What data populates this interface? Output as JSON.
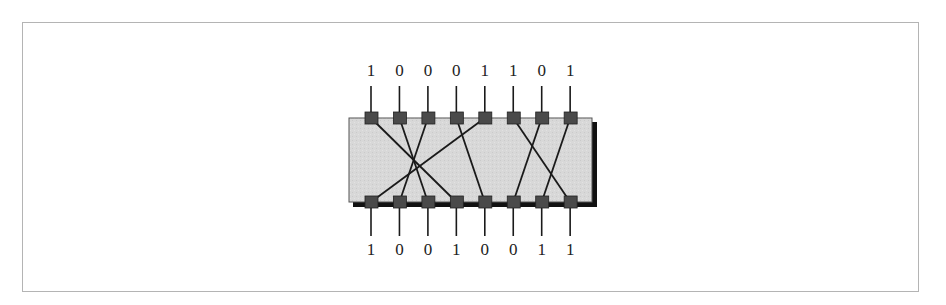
{
  "diagram": {
    "type": "bit-permutation-box",
    "pin_count": 8,
    "input_bits": [
      "1",
      "0",
      "0",
      "0",
      "1",
      "1",
      "0",
      "1"
    ],
    "output_bits": [
      "1",
      "0",
      "0",
      "1",
      "0",
      "0",
      "1",
      "1"
    ],
    "wiring": [
      {
        "from_input": 1,
        "to_output": 4
      },
      {
        "from_input": 2,
        "to_output": 3
      },
      {
        "from_input": 3,
        "to_output": 2
      },
      {
        "from_input": 4,
        "to_output": 5
      },
      {
        "from_input": 5,
        "to_output": 1
      },
      {
        "from_input": 6,
        "to_output": 8
      },
      {
        "from_input": 7,
        "to_output": 6
      },
      {
        "from_input": 8,
        "to_output": 7
      }
    ],
    "colors": {
      "box_fill": "#d6d6d6",
      "box_shadow": "#111111",
      "pin_fill": "#4a4a4a",
      "wire": "#1a1a1a",
      "frame": "#b4b4b4"
    }
  }
}
